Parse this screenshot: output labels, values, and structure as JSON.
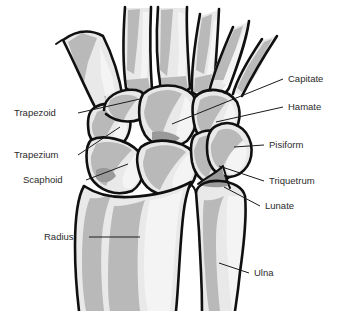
{
  "figure": {
    "background_color": "#ffffff",
    "outline_color": "#101010",
    "bone_fill_color": "#e9e9e9",
    "bone_shadow_color": "#b9b9b9",
    "bone_shadow_dark_color": "#9a9a9a",
    "label_text_color": "#2b2b2b"
  },
  "labels": {
    "trapezoid": {
      "text": "Trapezoid",
      "side": "left"
    },
    "trapezium": {
      "text": "Trapezium",
      "side": "left"
    },
    "scaphoid": {
      "text": "Scaphoid",
      "side": "left"
    },
    "radius": {
      "text": "Radius",
      "side": "left"
    },
    "capitate": {
      "text": "Capitate",
      "side": "right"
    },
    "hamate": {
      "text": "Hamate",
      "side": "right"
    },
    "pisiform": {
      "text": "Pisiform",
      "side": "right"
    },
    "triquetrum": {
      "text": "Triquetrum",
      "side": "right"
    },
    "lunate": {
      "text": "Lunate",
      "side": "right"
    },
    "ulna": {
      "text": "Ulna",
      "side": "right"
    }
  }
}
